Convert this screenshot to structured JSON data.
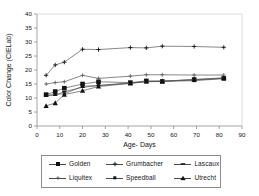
{
  "chart_data": {
    "type": "line",
    "title": "",
    "xlabel": "Age- Days",
    "ylabel": "Color Change (CIELab)",
    "xlim": [
      0,
      90
    ],
    "ylim": [
      0,
      40
    ],
    "xticks": [
      0,
      10,
      20,
      30,
      40,
      50,
      60,
      70,
      80,
      90
    ],
    "yticks": [
      0,
      5,
      10,
      15,
      20,
      25,
      30,
      35,
      40
    ],
    "grid": false,
    "legend_position": "below-plot",
    "x": [
      4,
      8,
      12,
      20,
      27,
      41,
      48,
      55,
      69,
      82
    ],
    "series": [
      {
        "name": "Golden",
        "marker": "filled-square",
        "values": [
          11.2,
          12.3,
          13.5,
          15.0,
          15.8,
          15.5,
          16.1,
          15.9,
          16.6,
          17.0
        ]
      },
      {
        "name": "Grumbacher",
        "marker": "plus",
        "values": [
          18.1,
          21.8,
          22.8,
          27.4,
          27.3,
          28.0,
          27.9,
          28.5,
          28.4,
          28.1
        ]
      },
      {
        "name": "Lascaux",
        "marker": "small-dash",
        "values": [
          10.8,
          11.0,
          12.3,
          13.8,
          14.5,
          15.4,
          15.9,
          16.1,
          16.4,
          17.1
        ]
      },
      {
        "name": "Liquitex",
        "marker": "open-plus",
        "values": [
          15.0,
          15.5,
          15.8,
          18.1,
          17.0,
          17.8,
          18.3,
          18.3,
          18.2,
          18.2
        ]
      },
      {
        "name": "Speedball",
        "marker": "small-square",
        "values": [
          11.0,
          11.3,
          11.5,
          14.2,
          14.4,
          15.3,
          15.8,
          15.9,
          16.2,
          16.9
        ]
      },
      {
        "name": "Utrecht",
        "marker": "filled-triangle",
        "values": [
          7.2,
          8.2,
          11.2,
          12.6,
          14.1,
          15.2,
          15.9,
          16.0,
          16.6,
          17.2
        ]
      }
    ]
  },
  "axes": {
    "x_label": "Age- Days",
    "y_label": "Color Change (CIELab)",
    "x_tick_labels": [
      "0",
      "10",
      "20",
      "30",
      "40",
      "50",
      "60",
      "70",
      "80",
      "90"
    ],
    "y_tick_labels": [
      "0",
      "5",
      "10",
      "15",
      "20",
      "25",
      "30",
      "35",
      "40"
    ]
  },
  "legend": {
    "entries": [
      {
        "label": "Golden",
        "marker": "filled-square"
      },
      {
        "label": "Grumbacher",
        "marker": "plus"
      },
      {
        "label": "Lascaux",
        "marker": "small-dash"
      },
      {
        "label": "Liquitex",
        "marker": "open-plus"
      },
      {
        "label": "Speedball",
        "marker": "small-square"
      },
      {
        "label": "Utrecht",
        "marker": "filled-triangle"
      }
    ]
  },
  "colors": {
    "line": "#555555",
    "marker": "#111111",
    "axis": "#8d8d8d",
    "text": "#151515",
    "background": "#ffffff"
  }
}
